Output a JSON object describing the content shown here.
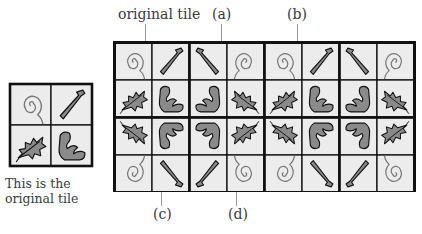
{
  "labels": {
    "original_tile": "original tile",
    "a": "(a)",
    "b": "(b)",
    "c": "(c)",
    "d": "(d)"
  },
  "caption": {
    "line1": "This is the",
    "line2": "original tile"
  },
  "tile_motifs": {
    "top_left": "spiral",
    "top_right": "stick",
    "bottom_left": "holly-leaf",
    "bottom_right": "curled-leaf"
  },
  "grid": {
    "rows_of_tiles": 2,
    "tiles_per_row": 4,
    "tiles": [
      {
        "row": 0,
        "col": 0,
        "flip_x": false,
        "flip_y": false
      },
      {
        "row": 0,
        "col": 1,
        "flip_x": true,
        "flip_y": false
      },
      {
        "row": 0,
        "col": 2,
        "flip_x": false,
        "flip_y": false
      },
      {
        "row": 0,
        "col": 3,
        "flip_x": true,
        "flip_y": false
      },
      {
        "row": 1,
        "col": 0,
        "flip_x": false,
        "flip_y": true
      },
      {
        "row": 1,
        "col": 1,
        "flip_x": true,
        "flip_y": true
      },
      {
        "row": 1,
        "col": 2,
        "flip_x": false,
        "flip_y": true
      },
      {
        "row": 1,
        "col": 3,
        "flip_x": true,
        "flip_y": true
      }
    ]
  },
  "colors": {
    "cell_bg": "#ececec",
    "border": "#111111",
    "motif_fill": "#8a8a8a",
    "spiral_stroke": "#777777"
  }
}
